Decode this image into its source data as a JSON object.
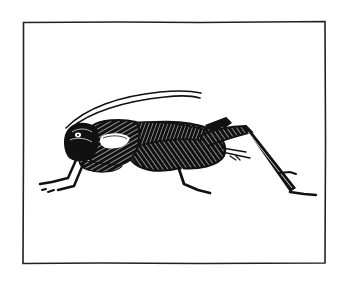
{
  "illustration": {
    "subject": "cricket",
    "style": "pen-and-ink hatched line drawing",
    "background_color": "#ffffff",
    "ink_color": "#111111",
    "frame": {
      "x": 23,
      "y": 22,
      "width": 302,
      "height": 241
    }
  }
}
